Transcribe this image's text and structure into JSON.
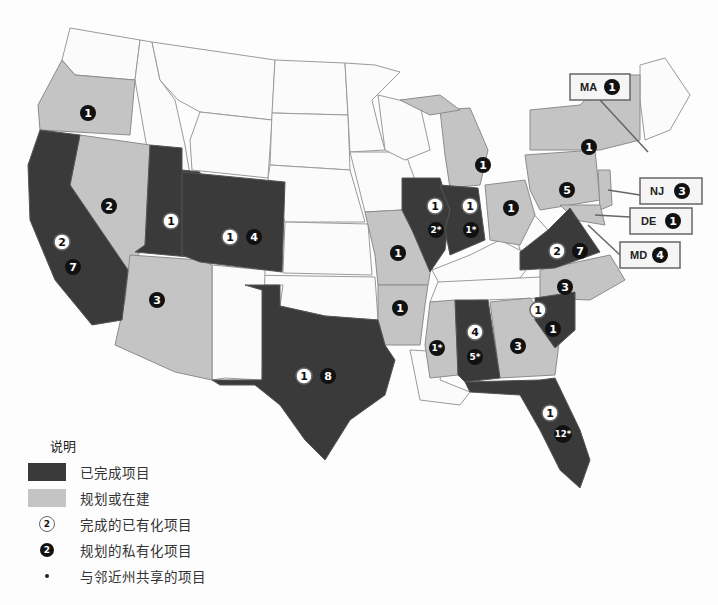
{
  "colors": {
    "completed_fill": "#3a3a3a",
    "planned_fill": "#c4c4c4",
    "none_fill": "#fbfbfb",
    "marker_white": "#ffffff",
    "marker_black": "#111111"
  },
  "legend": {
    "title": "说明",
    "items": [
      {
        "type": "swatch",
        "color": "#3a3a3a",
        "label": "已完成项目"
      },
      {
        "type": "swatch",
        "color": "#c4c4c4",
        "label": "规划或在建"
      },
      {
        "type": "white-marker",
        "symbol": "2",
        "label": "完成的已有化项目"
      },
      {
        "type": "black-marker",
        "symbol": "2",
        "label": "规划的私有化项目"
      },
      {
        "type": "dot",
        "symbol": "*",
        "label": "与邻近州共享的项目"
      }
    ]
  },
  "states": [
    {
      "name": "Oregon",
      "status": "planned",
      "markers": [
        {
          "style": "black",
          "value": "1"
        }
      ]
    },
    {
      "name": "California",
      "status": "completed",
      "markers": [
        {
          "style": "white",
          "value": "2"
        },
        {
          "style": "black",
          "value": "7"
        }
      ]
    },
    {
      "name": "Nevada",
      "status": "planned",
      "markers": [
        {
          "style": "black",
          "value": "2"
        }
      ]
    },
    {
      "name": "Utah",
      "status": "completed",
      "markers": [
        {
          "style": "white",
          "value": "1"
        }
      ]
    },
    {
      "name": "Colorado",
      "status": "completed",
      "markers": [
        {
          "style": "white",
          "value": "1"
        },
        {
          "style": "black",
          "value": "4"
        }
      ]
    },
    {
      "name": "Arizona",
      "status": "planned",
      "markers": [
        {
          "style": "black",
          "value": "3"
        }
      ]
    },
    {
      "name": "Texas",
      "status": "completed",
      "markers": [
        {
          "style": "white",
          "value": "1"
        },
        {
          "style": "black",
          "value": "8"
        }
      ]
    },
    {
      "name": "Missouri",
      "status": "planned",
      "markers": [
        {
          "style": "black",
          "value": "1"
        }
      ]
    },
    {
      "name": "Arkansas",
      "status": "planned",
      "markers": [
        {
          "style": "black",
          "value": "1"
        }
      ]
    },
    {
      "name": "Illinois",
      "status": "completed",
      "markers": [
        {
          "style": "white",
          "value": "1"
        },
        {
          "style": "black",
          "value": "2*"
        }
      ]
    },
    {
      "name": "Indiana",
      "status": "completed",
      "markers": [
        {
          "style": "white",
          "value": "1"
        },
        {
          "style": "black",
          "value": "1*"
        }
      ]
    },
    {
      "name": "Michigan",
      "status": "planned",
      "markers": [
        {
          "style": "black",
          "value": "1"
        }
      ]
    },
    {
      "name": "Ohio",
      "status": "planned",
      "markers": [
        {
          "style": "black",
          "value": "1"
        }
      ]
    },
    {
      "name": "Pennsylvania",
      "status": "planned",
      "markers": [
        {
          "style": "black",
          "value": "5"
        }
      ]
    },
    {
      "name": "New York",
      "status": "planned",
      "markers": [
        {
          "style": "black",
          "value": "1"
        }
      ]
    },
    {
      "name": "Virginia",
      "status": "completed",
      "markers": [
        {
          "style": "white",
          "value": "2"
        },
        {
          "style": "black",
          "value": "7"
        }
      ]
    },
    {
      "name": "North Carolina",
      "status": "planned",
      "markers": [
        {
          "style": "black",
          "value": "3"
        }
      ]
    },
    {
      "name": "South Carolina",
      "status": "completed",
      "markers": [
        {
          "style": "white",
          "value": "1"
        },
        {
          "style": "black",
          "value": "1"
        }
      ]
    },
    {
      "name": "Georgia",
      "status": "planned",
      "markers": [
        {
          "style": "black",
          "value": "3"
        }
      ]
    },
    {
      "name": "Alabama",
      "status": "completed",
      "markers": [
        {
          "style": "white",
          "value": "4"
        },
        {
          "style": "black",
          "value": "5*"
        }
      ]
    },
    {
      "name": "Mississippi",
      "status": "planned",
      "markers": [
        {
          "style": "black",
          "value": "1*"
        }
      ]
    },
    {
      "name": "Florida",
      "status": "completed",
      "markers": [
        {
          "style": "white",
          "value": "1"
        },
        {
          "style": "black",
          "value": "12*"
        }
      ]
    }
  ],
  "callouts": [
    {
      "label": "MA",
      "value": "1"
    },
    {
      "label": "NJ",
      "value": "3"
    },
    {
      "label": "DE",
      "value": "1"
    },
    {
      "label": "MD",
      "value": "4"
    }
  ]
}
